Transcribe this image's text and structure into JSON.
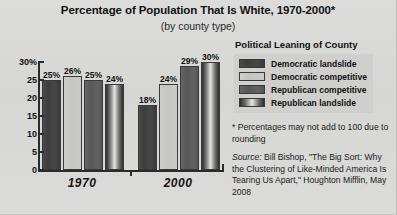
{
  "title": "Percentage of Population That Is White, 1970-2000*",
  "subtitle": "(by county type)",
  "legend": {
    "title": "Political Leaning of County",
    "items": [
      {
        "label": "Democratic landslide",
        "swatch": "dem-landslide",
        "color": "#3f3f3f"
      },
      {
        "label": "Democratic competitive",
        "swatch": "dem-competitive",
        "color": "#c9c9c7"
      },
      {
        "label": "Republican competitive",
        "swatch": "rep-competitive",
        "color": "#5d5d5d"
      },
      {
        "label": "Republican landslide",
        "swatch": "rep-landslide",
        "color": "#2e2e2e"
      }
    ]
  },
  "notes": {
    "footnote": "* Percentages may not add to 100 due to rounding",
    "source_prefix": "Source:",
    "source_body": " Bill Bishop, \"The Big Sort: Why the Clustering of Like-Minded America Is Tearing Us Apart,\" Houghton Mifflin, May 2008"
  },
  "axis": {
    "yticks": [
      "30%",
      "25",
      "20",
      "15",
      "10",
      "5",
      "0"
    ],
    "ytick_values": [
      30,
      25,
      20,
      15,
      10,
      5,
      0
    ]
  },
  "chart_data": {
    "type": "bar",
    "title": "Percentage of Population That Is White, 1970-2000*",
    "subtitle": "(by county type)",
    "xlabel": "",
    "ylabel": "",
    "ylim": [
      0,
      30
    ],
    "grid": false,
    "legend_position": "right",
    "categories": [
      "1970",
      "2000"
    ],
    "series": [
      {
        "name": "Democratic landslide",
        "values": [
          25,
          18
        ],
        "labels": [
          "25%",
          "18%"
        ]
      },
      {
        "name": "Democratic competitive",
        "values": [
          26,
          24
        ],
        "labels": [
          "26%",
          "24%"
        ]
      },
      {
        "name": "Republican competitive",
        "values": [
          25,
          29
        ],
        "labels": [
          "25%",
          "29%"
        ]
      },
      {
        "name": "Republican landslide",
        "values": [
          24,
          30
        ],
        "labels": [
          "24%",
          "30%"
        ]
      }
    ],
    "annotations": [
      "* Percentages may not add to 100 due to rounding"
    ]
  }
}
